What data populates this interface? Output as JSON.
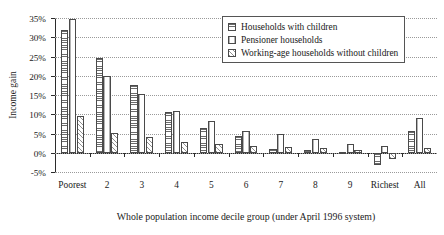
{
  "chart_data": {
    "type": "bar",
    "title": "",
    "xlabel": "Whole population income decile group (under April 1996 system)",
    "ylabel": "Income gain",
    "categories": [
      "Poorest",
      "2",
      "3",
      "4",
      "5",
      "6",
      "7",
      "8",
      "9",
      "Richest",
      "All"
    ],
    "ylim": [
      -5,
      35
    ],
    "ytick_values": [
      -5,
      0,
      5,
      10,
      15,
      20,
      25,
      30,
      35
    ],
    "ytick_labels": [
      "-5%",
      "0%",
      "5%",
      "10%",
      "15%",
      "20%",
      "25%",
      "30%",
      "35%"
    ],
    "grid": "horizontal-dotted",
    "legend_position": "top-right",
    "series": [
      {
        "name": "Households with children",
        "pattern": "horizontal-lines",
        "values": [
          31.8,
          24.5,
          17.5,
          10.7,
          6.4,
          4.3,
          1.1,
          0.6,
          0.2,
          -3.3,
          5.7
        ]
      },
      {
        "name": "Pensioner households",
        "pattern": "vertical-lines",
        "values": [
          34.8,
          19.9,
          15.2,
          10.8,
          8.2,
          5.7,
          5.0,
          3.7,
          2.2,
          1.7,
          8.9
        ]
      },
      {
        "name": "Working-age households without children",
        "pattern": "diagonal-hatch",
        "values": [
          9.6,
          5.2,
          4.1,
          2.9,
          2.2,
          1.8,
          1.5,
          1.3,
          0.7,
          -1.6,
          1.2
        ]
      }
    ]
  },
  "legend": {
    "items": [
      {
        "label": "Households with children",
        "swatch": "horizontal-lines-swatch"
      },
      {
        "label": "Pensioner households",
        "swatch": "vertical-lines-swatch"
      },
      {
        "label": "Working-age households without children",
        "swatch": "diagonal-hatch-swatch"
      }
    ]
  }
}
